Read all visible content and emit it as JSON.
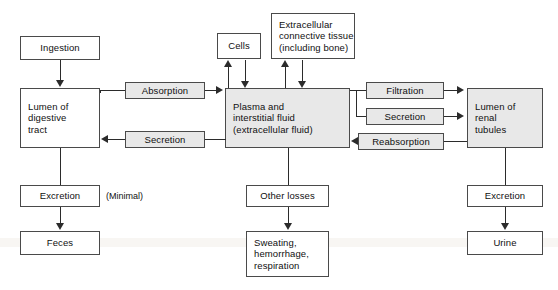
{
  "diagram": {
    "colors": {
      "box_border": "#4a4a4a",
      "box_fill_white": "#ffffff",
      "box_fill_shaded": "#e8e8e8",
      "line": "#2b2b2b",
      "text": "#101010",
      "background": "#ffffff"
    },
    "nodes": [
      {
        "id": "ingestion",
        "label": "Ingestion",
        "fill": "white"
      },
      {
        "id": "lumen_digestive",
        "label": "Lumen of\ndigestive\ntract",
        "fill": "white"
      },
      {
        "id": "excretion_left",
        "label": "Excretion",
        "fill": "white"
      },
      {
        "id": "feces",
        "label": "Feces",
        "fill": "white"
      },
      {
        "id": "cells",
        "label": "Cells",
        "fill": "white"
      },
      {
        "id": "ecm",
        "label": "Extracellular\nconnective tissue\n(including bone)",
        "fill": "white"
      },
      {
        "id": "plasma",
        "label": "Plasma and\ninterstitial fluid\n(extracellular fluid)",
        "fill": "shaded"
      },
      {
        "id": "other_losses",
        "label": "Other losses",
        "fill": "white"
      },
      {
        "id": "sweating",
        "label": "Sweating,\nhemorrhage,\nrespiration",
        "fill": "white"
      },
      {
        "id": "lumen_renal",
        "label": "Lumen of\nrenal\ntubules",
        "fill": "shaded"
      },
      {
        "id": "excretion_right",
        "label": "Excretion",
        "fill": "white"
      },
      {
        "id": "urine",
        "label": "Urine",
        "fill": "white"
      }
    ],
    "process_labels": [
      {
        "id": "absorption",
        "label": "Absorption",
        "fill": "shaded"
      },
      {
        "id": "secretion_gi",
        "label": "Secretion",
        "fill": "shaded"
      },
      {
        "id": "filtration",
        "label": "Filtration",
        "fill": "shaded"
      },
      {
        "id": "secretion_rn",
        "label": "Secretion",
        "fill": "shaded"
      },
      {
        "id": "reabsorption",
        "label": "Reabsorption",
        "fill": "shaded"
      }
    ],
    "annotations": [
      {
        "id": "minimal_note",
        "label": "(Minimal)"
      }
    ]
  }
}
